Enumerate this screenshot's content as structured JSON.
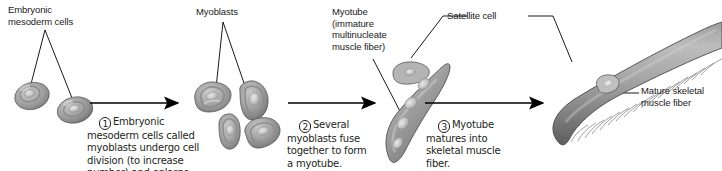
{
  "figure": {
    "background_color": "#ffffff",
    "line_color": "#000000",
    "text_color": "#231f20"
  },
  "labels": {
    "embryonic_mesoderm_cells": "Embryonic\nmesoderm cells",
    "myoblasts": "Myoblasts",
    "myotube": "Myotube\n(immature\nmultinucleate\nmuscle fiber)",
    "satellite_cell": "Satellite cell",
    "mature_skeletal_muscle_fiber": "Mature skeletal\nmuscle fiber"
  },
  "steps": [
    {
      "number": "1",
      "text": "Embryonic\nmesoderm cells called\nmyoblasts undergo cell\ndivision (to increase\nnumber) and enlarge."
    },
    {
      "number": "2",
      "text": "Several\nmyoblasts fuse\ntogether to form\na myotube."
    },
    {
      "number": "3",
      "text": "Myotube\nmatures into\nskeletal muscle\nfiber."
    }
  ],
  "stages": [
    {
      "name": "embryonic-mesoderm-cells",
      "cell_count": 2,
      "description": "Two small rounded embryonic mesoderm cells"
    },
    {
      "name": "myoblasts",
      "cell_count": 4,
      "description": "Four enlarged elongated myoblast cells"
    },
    {
      "name": "myotube",
      "cell_count": 1,
      "description": "One elongated multinucleate myotube with an attached satellite cell"
    },
    {
      "name": "mature-skeletal-muscle-fiber",
      "cell_count": 1,
      "description": "One long striated mature skeletal muscle fiber with satellite cell"
    }
  ],
  "arrows": [
    {
      "name": "arrow-step-1",
      "from_stage": "embryonic-mesoderm-cells",
      "to_stage": "myoblasts"
    },
    {
      "name": "arrow-step-2",
      "from_stage": "myoblasts",
      "to_stage": "myotube"
    },
    {
      "name": "arrow-step-3",
      "from_stage": "myotube",
      "to_stage": "mature-skeletal-muscle-fiber"
    }
  ]
}
